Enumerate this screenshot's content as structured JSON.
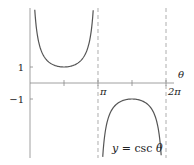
{
  "chart_data": {
    "type": "line",
    "title": "",
    "function_label": "y = csc θ",
    "function_label_parts": {
      "y": "y",
      "eq": " = csc ",
      "theta": "θ"
    },
    "xlabel": "θ",
    "ylabel": "",
    "x_ticks": [
      {
        "value": 1.5708,
        "label": ""
      },
      {
        "value": 3.14159,
        "label": "π"
      },
      {
        "value": 4.71239,
        "label": ""
      },
      {
        "value": 6.28319,
        "label": "2π"
      }
    ],
    "y_ticks": [
      {
        "value": 1,
        "label": "1"
      },
      {
        "value": -1,
        "label": "−1"
      }
    ],
    "asymptotes": [
      3.14159,
      6.28319
    ],
    "xlim": [
      0,
      6.6
    ],
    "ylim": [
      -4.6,
      4.6
    ],
    "grid": false,
    "series": [
      {
        "name": "csc θ (0, π)",
        "domain": [
          0.22,
          2.92
        ],
        "min_point": {
          "x": 1.5708,
          "y": 1
        }
      },
      {
        "name": "csc θ (π, 2π)",
        "domain": [
          3.36,
          6.06
        ],
        "max_point": {
          "x": 4.71239,
          "y": -1
        }
      }
    ],
    "colors": {
      "curve": "#555555",
      "axis": "#888888",
      "asymptote": "#999999"
    }
  }
}
